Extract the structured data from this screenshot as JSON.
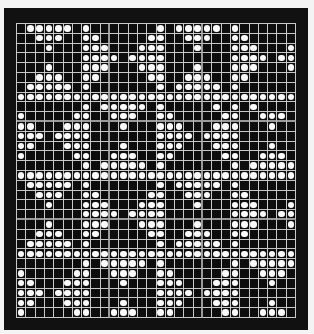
{
  "colors": {
    "background": "#111111",
    "grid_line": "#c8c8c8",
    "dot": "#fafafa"
  },
  "grid": {
    "cols": 30,
    "rows": 30,
    "block_size": 10,
    "pattern": [
      ".XXXXX.X.......X.XXXXX.X......",
      "..XXX..XX.....XX..XXX..XX.....",
      "...X...XXX...XXX...X...XXX...X",
      ".......XXXX.XXXX.......XXXX.XX",
      "...X...XXX...XXX...X...XXX...X",
      "..XXX..XX.....XX..XXX..XX.....",
      ".XXXXX.X.......X.XXXXX.X......",
      "XXXXXXXXXXXXXXXXXXXXXXXXXXXXXX",
      ".......X.XXXXX.X.....X.X.X....",
      "X.....XX..XXX..XX.....XX..XXX.",
      "XX...XXX...X...XXX...XXX...X..",
      "XXX.XXXX.......XXXX.XXXX......",
      "XX...XXX...X...XXX...XXX...X..",
      "X.....XX..XXX..XX.....XX..XXX.",
      ".......X.XXXXX.X.......X.XXXXX",
      "XXXXXXXXXXXXXXXXXXXXXXXXXXXXXX",
      ".XXXXX.X.......X.XXXXX.X......",
      "..XXX..XX.....XX..XXX..XX.....",
      "...X...XXX...XXX...X...XXX...X",
      ".......XXXX.XXXX.......XXXX.XX",
      "...X...XXX...XXX...X...XXX...X",
      "..XXX..XX.....XX..XXX..XX.....",
      ".XXXXX.X.......X.XXXXX.X......",
      "XXXXXXXXXXXXXXXXXXXXXXXXXXXXXX",
      ".......X.XXXXX.X.......X.XXXXX",
      "X.....XX..XXX..XX.....XX..XXX.",
      "XX...XXX...X...XXX...XXX...X..",
      "XXX.XXXX.......XXXX.XXXX......",
      "XX...XXX...X...XXX...XXX...X..",
      "X.....XX..XXX..XX.....XX..XXX."
    ]
  }
}
